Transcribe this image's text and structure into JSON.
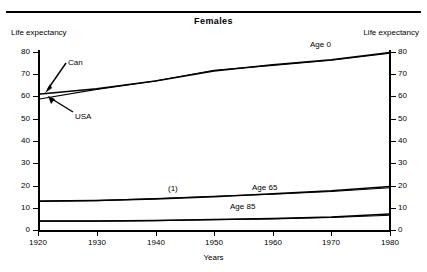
{
  "header": {
    "title": "Females"
  },
  "axes": {
    "left_caption": "Life expectancy",
    "right_caption": "Life expectancy",
    "x_title": "Years",
    "y_ticks": [
      "0",
      "10",
      "20",
      "30",
      "40",
      "50",
      "60",
      "70",
      "80"
    ],
    "x_ticks": [
      "1920",
      "1930",
      "1940",
      "1950",
      "1960",
      "1970",
      "1980"
    ]
  },
  "annotations": {
    "can": "Can",
    "usa": "USA",
    "age0": "Age 0",
    "age65": "Age 65",
    "age85": "Age 85",
    "footnote_marker": "(1)"
  },
  "chart_data": {
    "type": "line",
    "title": "Females",
    "xlabel": "Years",
    "ylabel": "Life expectancy",
    "ylim": [
      0,
      80
    ],
    "xlim": [
      1920,
      1980
    ],
    "yticks": [
      0,
      10,
      20,
      30,
      40,
      50,
      60,
      70,
      80
    ],
    "xticks": [
      1920,
      1930,
      1940,
      1950,
      1960,
      1970,
      1980
    ],
    "grid": false,
    "legend": "inline-annotations",
    "x": [
      1920,
      1930,
      1940,
      1950,
      1960,
      1970,
      1980
    ],
    "series": [
      {
        "name": "Age 0 - Can",
        "group": "Age 0",
        "country": "Can",
        "values": [
          61.0,
          63.5,
          67.0,
          71.5,
          74.3,
          76.5,
          79.8
        ]
      },
      {
        "name": "Age 0 - USA",
        "group": "Age 0",
        "country": "USA",
        "values": [
          58.8,
          63.2,
          67.0,
          71.8,
          74.0,
          76.3,
          79.5
        ]
      },
      {
        "name": "Age 65 - Can",
        "group": "Age 65",
        "country": "Can",
        "values": [
          13.0,
          13.3,
          13.9,
          15.0,
          16.3,
          17.6,
          19.5
        ]
      },
      {
        "name": "Age 65 - USA",
        "group": "Age 65",
        "country": "USA",
        "values": [
          12.8,
          13.2,
          14.1,
          15.2,
          16.1,
          17.3,
          19.0
        ]
      },
      {
        "name": "Age 85 - Can",
        "group": "Age 85",
        "country": "Can",
        "values": [
          4.0,
          4.1,
          4.3,
          4.7,
          5.2,
          5.8,
          7.2
        ]
      },
      {
        "name": "Age 85 - USA",
        "group": "Age 85",
        "country": "USA",
        "values": [
          4.0,
          4.0,
          4.2,
          4.6,
          5.0,
          5.6,
          6.6
        ]
      }
    ],
    "annotations": [
      {
        "text": "Age 0",
        "x": 1973,
        "y": 82
      },
      {
        "text": "Age 65",
        "x": 1962,
        "y": 22
      },
      {
        "text": "Age 85",
        "x": 1957,
        "y": 13
      },
      {
        "text": "(1)",
        "x": 1942,
        "y": 22
      },
      {
        "text": "Can",
        "x": 1925,
        "y": 72,
        "arrow_to": [
          1921,
          61.5
        ]
      },
      {
        "text": "USA",
        "x": 1926,
        "y": 48,
        "arrow_to": [
          1921,
          58.5
        ]
      }
    ]
  }
}
